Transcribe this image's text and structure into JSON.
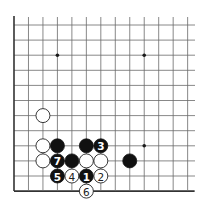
{
  "board": {
    "origin_x": 14,
    "origin_y": 25,
    "spacing_x": 14.47,
    "spacing_y": 15.1,
    "cols": 13,
    "rows": 12,
    "left_edge": true,
    "bottom_edge": true,
    "top_edge": false,
    "right_edge": false,
    "left_edge_top_y": 16,
    "right_extent_x": 195,
    "stone_radius": 7,
    "colors": {
      "black": "#111111",
      "white": "#ffffff",
      "line": "#6a6a6a"
    }
  },
  "star_points": [
    {
      "col": 3,
      "row": 2
    },
    {
      "col": 9,
      "row": 2
    },
    {
      "col": 9,
      "row": 8
    }
  ],
  "stones": [
    {
      "color": "white",
      "col": 2,
      "row": 6,
      "label": ""
    },
    {
      "color": "white",
      "col": 2,
      "row": 8,
      "label": ""
    },
    {
      "color": "black",
      "col": 3,
      "row": 8,
      "label": ""
    },
    {
      "color": "black",
      "col": 5,
      "row": 8,
      "label": ""
    },
    {
      "color": "black",
      "col": 6,
      "row": 8,
      "label": "3"
    },
    {
      "color": "white",
      "col": 2,
      "row": 9,
      "label": ""
    },
    {
      "color": "black",
      "col": 3,
      "row": 9,
      "label": "7"
    },
    {
      "color": "black",
      "col": 4,
      "row": 9,
      "label": ""
    },
    {
      "color": "white",
      "col": 5,
      "row": 9,
      "label": ""
    },
    {
      "color": "white",
      "col": 6,
      "row": 9,
      "label": ""
    },
    {
      "color": "black",
      "col": 8,
      "row": 9,
      "label": ""
    },
    {
      "color": "black",
      "col": 3,
      "row": 10,
      "label": "5"
    },
    {
      "color": "white",
      "col": 4,
      "row": 10,
      "label": "4"
    },
    {
      "color": "black",
      "col": 5,
      "row": 10,
      "label": "1"
    },
    {
      "color": "white",
      "col": 6,
      "row": 10,
      "label": "2"
    },
    {
      "color": "white",
      "col": 5,
      "row": 11,
      "label": "6"
    }
  ]
}
